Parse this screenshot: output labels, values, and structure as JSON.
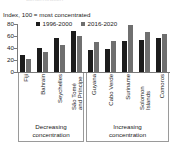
{
  "header": {
    "clipped_text": "concentration"
  },
  "subtitle": "Index, 100 = most concentrated",
  "legend": {
    "position": "top",
    "items": [
      {
        "label": "1996-2000",
        "color": "#1c1c1c"
      },
      {
        "label": "2016-2020",
        "color": "#6f6f6f"
      }
    ]
  },
  "groups": [
    {
      "label_line1": "Decreasing",
      "label_line2": "concentration",
      "count": 4
    },
    {
      "label_line1": "Increasing",
      "label_line2": "concentration",
      "count": 5
    }
  ],
  "chart_data": {
    "type": "bar",
    "title": "",
    "subtitle": "Index, 100 = most concentrated",
    "xlabel": "",
    "ylabel": "",
    "ylim": [
      0,
      80
    ],
    "yticks": [
      0,
      20,
      40,
      60,
      80
    ],
    "ytick_labels": [
      "0",
      "20",
      "40",
      "60",
      "80"
    ],
    "grid": false,
    "legend_position": "top",
    "categories": [
      "Fiji",
      "Bahrain",
      "Seychelles",
      "São Tomé and Príncipe",
      "Guyana",
      "Cabo Verde",
      "Suriname",
      "Solomon Islands",
      "Comoros"
    ],
    "group_assignment": [
      "Decreasing concentration",
      "Decreasing concentration",
      "Decreasing concentration",
      "Decreasing concentration",
      "Increasing concentration",
      "Increasing concentration",
      "Increasing concentration",
      "Increasing concentration",
      "Increasing concentration"
    ],
    "series": [
      {
        "name": "1996-2000",
        "color": "#1c1c1c",
        "values": [
          28,
          40,
          56,
          69,
          36,
          39,
          52,
          54,
          57
        ]
      },
      {
        "name": "2016-2020",
        "color": "#6f6f6f",
        "values": [
          21,
          33,
          45,
          60,
          50,
          52,
          78,
          67,
          64
        ]
      }
    ]
  }
}
